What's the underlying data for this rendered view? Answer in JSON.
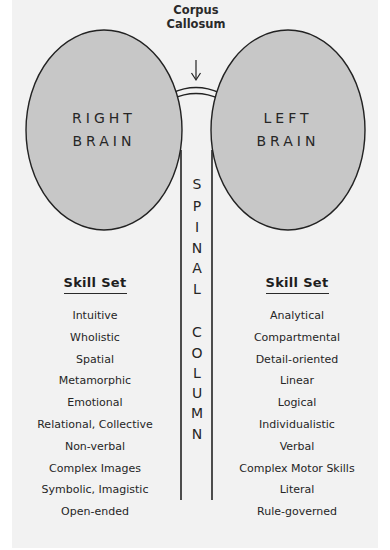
{
  "diagram": {
    "callout": {
      "line1": "Corpus",
      "line2": "Callosum"
    },
    "hemispheres": {
      "right": {
        "line1": "RIGHT",
        "line2": "BRAIN"
      },
      "left": {
        "line1": "LEFT",
        "line2": "BRAIN"
      }
    },
    "spine": {
      "word1": [
        "S",
        "P",
        "I",
        "N",
        "A",
        "L"
      ],
      "word2": [
        "C",
        "O",
        "L",
        "U",
        "M",
        "N"
      ]
    },
    "colors": {
      "panel": "#f2f2f2",
      "hemisphere_fill": "#c7c7c7",
      "stroke": "#222222"
    }
  },
  "skill_sets": {
    "right_brain": {
      "heading": "Skill Set",
      "items": [
        "Intuitive",
        "Wholistic",
        "Spatial",
        "Metamorphic",
        "Emotional",
        "Relational, Collective",
        "Non-verbal",
        "Complex Images",
        "Symbolic, Imagistic",
        "Open-ended"
      ]
    },
    "left_brain": {
      "heading": "Skill Set",
      "items": [
        "Analytical",
        "Compartmental",
        "Detail-oriented",
        "Linear",
        "Logical",
        "Individualistic",
        "Verbal",
        "Complex Motor Skills",
        "Literal",
        "Rule-governed"
      ]
    }
  }
}
